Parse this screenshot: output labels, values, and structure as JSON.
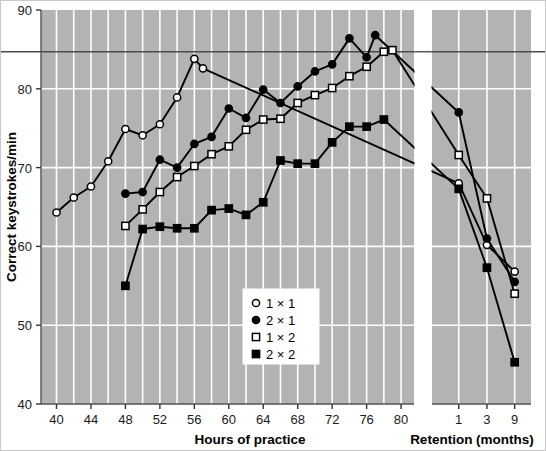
{
  "chart_data": {
    "type": "line",
    "title": "",
    "xlabel": "Hours of practice",
    "xlabel2": "Retention (months)",
    "ylabel": "Correct keystrokes/min",
    "ylim": [
      40,
      90
    ],
    "yticks": [
      40,
      50,
      60,
      70,
      80,
      90
    ],
    "xticks_practice": [
      40,
      44,
      48,
      52,
      56,
      60,
      64,
      68,
      72,
      76,
      80
    ],
    "xticks_retention": [
      1,
      3,
      9
    ],
    "grid": true,
    "grid_color": "#ffffff",
    "plot_background": "#b3b3b3",
    "legend_position": "bottom-center",
    "reference_line_y": 84.7,
    "series": [
      {
        "name": "1 × 1",
        "marker": "open-circle",
        "color": "#000000",
        "practice": {
          "x": [
            40,
            42,
            44,
            46,
            48,
            50,
            52,
            54,
            56,
            57
          ],
          "y": [
            64.3,
            66.2,
            67.6,
            70.8,
            74.9,
            74.1,
            75.5,
            78.9,
            83.8,
            82.6
          ]
        },
        "retention": {
          "x": [
            1,
            3,
            9
          ],
          "y": [
            68.0,
            60.2,
            56.8
          ]
        }
      },
      {
        "name": "2 × 1",
        "marker": "filled-circle",
        "color": "#000000",
        "practice": {
          "x": [
            48,
            50,
            52,
            54,
            56,
            58,
            60,
            62,
            64,
            66,
            68,
            70,
            72,
            74,
            76,
            77
          ],
          "y": [
            66.7,
            66.9,
            71.0,
            70.0,
            73.0,
            73.9,
            77.5,
            76.3,
            79.9,
            78.2,
            80.3,
            82.2,
            83.1,
            86.4,
            84.0,
            86.8
          ]
        },
        "retention": {
          "x": [
            1,
            3,
            9
          ],
          "y": [
            77.0,
            61.0,
            55.5
          ]
        }
      },
      {
        "name": "1 × 2",
        "marker": "open-square",
        "color": "#000000",
        "practice": {
          "x": [
            48,
            50,
            52,
            54,
            56,
            58,
            60,
            62,
            64,
            66,
            68,
            70,
            72,
            74,
            76,
            78,
            79
          ],
          "y": [
            62.6,
            64.7,
            66.9,
            68.8,
            70.2,
            71.7,
            72.7,
            74.8,
            76.1,
            76.2,
            78.2,
            79.2,
            80.1,
            81.6,
            82.8,
            84.7,
            84.9
          ]
        },
        "retention": {
          "x": [
            1,
            3,
            9
          ],
          "y": [
            71.6,
            66.1,
            54.0
          ]
        }
      },
      {
        "name": "2 × 2",
        "marker": "filled-square",
        "color": "#000000",
        "practice": {
          "x": [
            48,
            50,
            52,
            54,
            56,
            58,
            60,
            62,
            64,
            66,
            68,
            70,
            72,
            74,
            76,
            78
          ],
          "y": [
            55.0,
            62.2,
            62.5,
            62.3,
            62.3,
            64.6,
            64.8,
            64.0,
            65.6,
            70.9,
            70.5,
            70.5,
            73.2,
            75.2,
            75.2,
            76.1
          ]
        },
        "retention": {
          "x": [
            1,
            3,
            9
          ],
          "y": [
            67.3,
            57.3,
            45.3
          ]
        }
      }
    ]
  },
  "legend": {
    "entries": [
      {
        "label": "1 × 1",
        "marker": "open-circle"
      },
      {
        "label": "2 × 1",
        "marker": "filled-circle"
      },
      {
        "label": "1 × 2",
        "marker": "open-square"
      },
      {
        "label": "2 × 2",
        "marker": "filled-square"
      }
    ]
  }
}
